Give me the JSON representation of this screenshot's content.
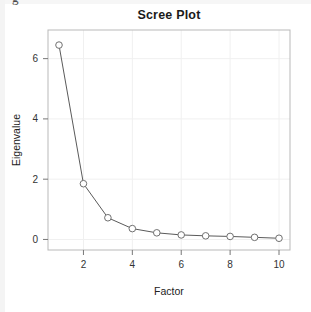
{
  "figure": {
    "title": "Scree Plot",
    "background_color": "#ffffff",
    "frame_color": "#b9b9b9",
    "grid_color": "#f0f0f0",
    "line_color": "#5a5a5a",
    "marker_edge_color": "#707070",
    "marker_fill_color": "#ffffff",
    "text_color": "#222222"
  },
  "axes": {
    "x_title": "Factor",
    "y_title": "Eigenvalue",
    "x_ticks": [
      "2",
      "4",
      "6",
      "8",
      "10"
    ],
    "y_ticks": [
      "0",
      "2",
      "4",
      "6"
    ]
  },
  "chart_data": {
    "type": "line",
    "title": "Scree Plot",
    "xlabel": "Factor",
    "ylabel": "Eigenvalue",
    "x": [
      1,
      2,
      3,
      4,
      5,
      6,
      7,
      8,
      9,
      10
    ],
    "values": [
      6.45,
      1.85,
      0.72,
      0.36,
      0.22,
      0.15,
      0.12,
      0.1,
      0.07,
      0.04
    ],
    "xlim": [
      0.55,
      10.45
    ],
    "ylim": [
      -0.35,
      6.95
    ],
    "xticks": [
      2,
      4,
      6,
      8,
      10
    ],
    "yticks": [
      0,
      2,
      4,
      6
    ],
    "grid": true,
    "legend": null,
    "marker": "open-circle",
    "series": [
      {
        "name": "Eigenvalue",
        "values": [
          6.45,
          1.85,
          0.72,
          0.36,
          0.22,
          0.15,
          0.12,
          0.1,
          0.07,
          0.04
        ]
      }
    ]
  }
}
